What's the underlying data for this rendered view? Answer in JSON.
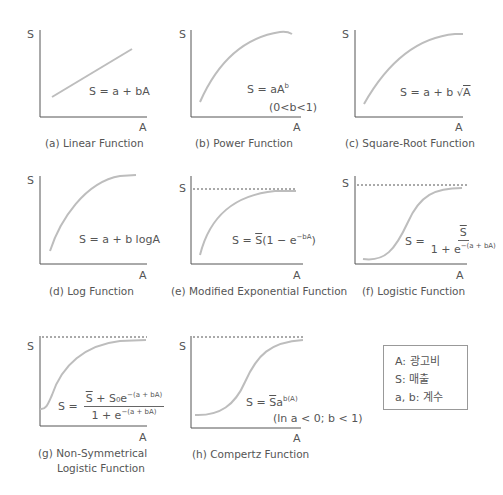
{
  "axis_labels": {
    "y": "S",
    "x": "A"
  },
  "panels": [
    {
      "id": "a",
      "caption": "(a) Linear Function",
      "equation": "S = a + bA"
    },
    {
      "id": "b",
      "caption": "(b) Power Function",
      "equation_main": "S = aA",
      "equation_sup": "b",
      "condition": "(0<b<1)"
    },
    {
      "id": "c",
      "caption": "(c) Square-Root Function",
      "equation_prefix": "S = a + b ",
      "equation_root": "√",
      "equation_radicand": "A"
    },
    {
      "id": "d",
      "caption": "(d) Log Function",
      "equation": "S = a + b logA"
    },
    {
      "id": "e",
      "caption": "(e) Modified Exponential Function",
      "equation_pre": "S = ",
      "equation_sbar": "S",
      "equation_mid": "(1 − e",
      "equation_sup": "−bA",
      "equation_post": ")"
    },
    {
      "id": "f",
      "caption": "(f) Logistic Function",
      "equation_lhs": "S =",
      "numerator": "S",
      "denominator_pre": "1 + e",
      "denominator_sup": "−(a + bA)"
    },
    {
      "id": "g",
      "caption_line1": "(g) Non-Symmetrical",
      "caption_line2": "Logistic Function",
      "equation_lhs": "S =",
      "numerator_sbar": "S",
      "numerator_mid": " + S₀e",
      "numerator_sup": "−(a + bA)",
      "denominator_pre": "1 + e",
      "denominator_sup": "−(a + bA)"
    },
    {
      "id": "h",
      "caption": "(h) Compertz Function",
      "equation_pre": "S = ",
      "equation_sbar": "S",
      "equation_mid": "a",
      "equation_sup": "b(A)",
      "condition": "(ln a < 0; b < 1)"
    }
  ],
  "legend": {
    "items": [
      "A: 광고비",
      "S: 매출",
      "a, b: 계수"
    ]
  },
  "colors": {
    "axis": "#555555",
    "curve": "#bdbdbd",
    "asymptote": "#555555",
    "text": "#555555"
  }
}
